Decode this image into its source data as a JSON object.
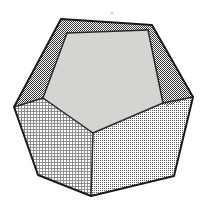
{
  "figure": {
    "name": "dodecahedron",
    "background_color": "#ffffff",
    "outline_color": "#1a1a1a",
    "outline_width": 2.0,
    "inner_edge_color": "#2b2b2b",
    "inner_edge_width": 1.5,
    "canvas": {
      "width": 208,
      "height": 211
    },
    "silhouette": {
      "name": "outer-decagon-outline",
      "points": "61,19 152,25 193,97 174,176 91,196 38,175 14,107"
    },
    "faces": [
      {
        "id": "face-top",
        "name": "top-face",
        "label": "Top face",
        "shading": "dark-dither",
        "fill_color": "#7d7d7d",
        "pattern": "checker-dense",
        "points": "61,19 152,25 148,30 67,33"
      },
      {
        "id": "face-upper-left",
        "name": "upper-left-face",
        "label": "Upper-left face",
        "shading": "dark-dither",
        "fill_color": "#7d7d7d",
        "pattern": "checker-dense",
        "points": "61,19 67,33 43,98 40,100 14,107"
      },
      {
        "id": "face-upper-right",
        "name": "upper-right-face",
        "label": "Upper-right face",
        "shading": "dark-dither",
        "fill_color": "#767676",
        "pattern": "checker-dense",
        "points": "152,25 193,97 166,106 163,103 148,30"
      },
      {
        "id": "face-center",
        "name": "center-face",
        "label": "Front pentagon face",
        "shading": "light-solid",
        "fill_color": "#d4d4d2",
        "pattern": "solid",
        "points": "67,33 148,30 163,103 93,133 43,98"
      },
      {
        "id": "face-lower-left",
        "name": "lower-left-face",
        "label": "Lower-left face",
        "shading": "light-crosshatch",
        "fill_color": "#cfcfcf",
        "pattern": "crosshatch-fine",
        "points": "14,107 40,100 43,98 93,133 91,196 38,175"
      },
      {
        "id": "face-lower-right",
        "name": "lower-right-face",
        "label": "Lower-right face",
        "shading": "medium-checker",
        "fill_color": "#c2c2c2",
        "pattern": "checker-medium",
        "points": "93,133 163,103 166,106 193,97 174,176 91,196"
      }
    ],
    "inner_edges": [
      {
        "name": "edge-center-top-left",
        "x1": 67,
        "y1": 33,
        "x2": 148,
        "y2": 30
      },
      {
        "name": "edge-center-left",
        "x1": 67,
        "y1": 33,
        "x2": 43,
        "y2": 98
      },
      {
        "name": "edge-center-right",
        "x1": 148,
        "y1": 30,
        "x2": 163,
        "y2": 103
      },
      {
        "name": "edge-center-bottom-left",
        "x1": 43,
        "y1": 98,
        "x2": 93,
        "y2": 133
      },
      {
        "name": "edge-center-bottom-right",
        "x1": 163,
        "y1": 103,
        "x2": 93,
        "y2": 133
      },
      {
        "name": "edge-left-spur",
        "x1": 43,
        "y1": 98,
        "x2": 14,
        "y2": 107
      },
      {
        "name": "edge-right-spur",
        "x1": 163,
        "y1": 103,
        "x2": 193,
        "y2": 97
      },
      {
        "name": "edge-bottom-spur",
        "x1": 93,
        "y1": 133,
        "x2": 91,
        "y2": 196
      }
    ],
    "artifacts": [
      {
        "name": "speck-top",
        "x": 111,
        "y": 12
      },
      {
        "name": "speck-center",
        "x": 62,
        "y": 93
      }
    ]
  }
}
